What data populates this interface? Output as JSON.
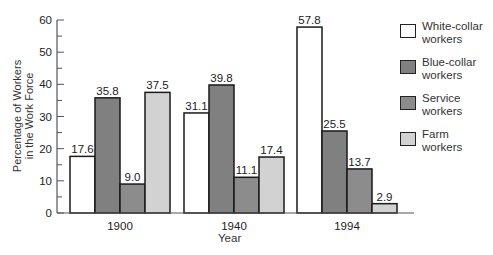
{
  "chart_data": {
    "type": "bar",
    "title": "",
    "xlabel": "Year",
    "ylabel": "Percentage of Workers in the Work Force",
    "ylabel_lines": [
      "Percentage of Workers",
      "in the Work Force"
    ],
    "ylim": [
      0,
      60
    ],
    "yticks": [
      0,
      10,
      20,
      30,
      40,
      50,
      60
    ],
    "grid": false,
    "legend_position": "right",
    "categories": [
      "1900",
      "1940",
      "1994"
    ],
    "series": [
      {
        "name": "White-collar workers",
        "color": "#ffffff",
        "values": [
          17.6,
          31.1,
          57.8
        ]
      },
      {
        "name": "Blue-collar workers",
        "color": "#808080",
        "values": [
          35.8,
          39.8,
          25.5
        ]
      },
      {
        "name": "Service workers",
        "color": "#8c8c8c",
        "values": [
          9.0,
          11.1,
          13.7
        ]
      },
      {
        "name": "Farm workers",
        "color": "#d2d2d2",
        "values": [
          37.5,
          17.4,
          2.9
        ]
      }
    ],
    "data_labels": [
      [
        "17.6",
        "35.8",
        "9.0",
        "37.5"
      ],
      [
        "31.1",
        "39.8",
        "11.1",
        "17.4"
      ],
      [
        "57.8",
        "25.5",
        "13.7",
        "2.9"
      ]
    ]
  },
  "legend": {
    "items": [
      {
        "line1": "White-collar",
        "line2": "workers",
        "color": "#ffffff"
      },
      {
        "line1": "Blue-collar",
        "line2": "workers",
        "color": "#808080"
      },
      {
        "line1": "Service",
        "line2": "workers",
        "color": "#8c8c8c"
      },
      {
        "line1": "Farm",
        "line2": "workers",
        "color": "#d2d2d2"
      }
    ]
  }
}
